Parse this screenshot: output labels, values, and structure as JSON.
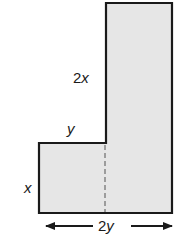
{
  "diagram": {
    "shape": "L-shaped figure composed of two rectangles",
    "fill_color": "#e6e6e6",
    "stroke_color": "#1a1a1a",
    "dashed_color": "#8a8a8a",
    "labels": {
      "tall_height": "2x",
      "step_width": "y",
      "short_height": "x",
      "total_width": "2y"
    }
  }
}
